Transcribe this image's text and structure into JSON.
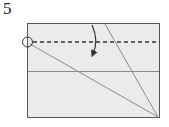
{
  "diagram": {
    "step_number": "5",
    "colors": {
      "paper_fill": "#ebebeb",
      "paper_edge": "#555555",
      "crease": "#8a8a8a",
      "valley_fold": "#333333",
      "arrow": "#333333"
    }
  }
}
